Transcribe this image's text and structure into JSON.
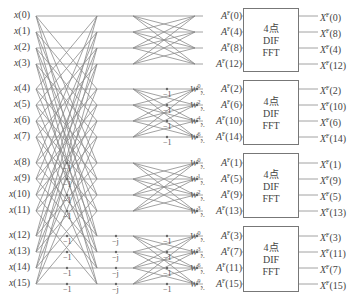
{
  "inputs": [
    "x(0)",
    "x(1)",
    "x(2)",
    "x(3)",
    "x(4)",
    "x(5)",
    "x(6)",
    "x(7)",
    "x(8)",
    "x(9)",
    "x(10)",
    "x(11)",
    "x(12)",
    "x(13)",
    "x(14)",
    "x(15)"
  ],
  "intermediate": [
    {
      "label": "A",
      "sup": "F",
      "idx": "(0)"
    },
    {
      "label": "A",
      "sup": "F",
      "idx": "(4)"
    },
    {
      "label": "A",
      "sup": "F",
      "idx": "(8)"
    },
    {
      "label": "A",
      "sup": "F",
      "idx": "(12)"
    },
    {
      "label": "A",
      "sup": "F",
      "idx": "(2)"
    },
    {
      "label": "A",
      "sup": "F",
      "idx": "(6)"
    },
    {
      "label": "A",
      "sup": "F",
      "idx": "(10)"
    },
    {
      "label": "A",
      "sup": "F",
      "idx": "(14)"
    },
    {
      "label": "A",
      "sup": "F",
      "idx": "(1)"
    },
    {
      "label": "A",
      "sup": "F",
      "idx": "(5)"
    },
    {
      "label": "A",
      "sup": "F",
      "idx": "(9)"
    },
    {
      "label": "A",
      "sup": "F",
      "idx": "(13)"
    },
    {
      "label": "A",
      "sup": "F",
      "idx": "(3)"
    },
    {
      "label": "A",
      "sup": "F",
      "idx": "(7)"
    },
    {
      "label": "A",
      "sup": "F",
      "idx": "(11)"
    },
    {
      "label": "A",
      "sup": "F",
      "idx": "(15)"
    }
  ],
  "twiddles": [
    {
      "row": 4,
      "exp": "0",
      "base": "W",
      "sub": "N"
    },
    {
      "row": 5,
      "exp": "2",
      "base": "W",
      "sub": "N"
    },
    {
      "row": 6,
      "exp": "4",
      "base": "W",
      "sub": "N"
    },
    {
      "row": 7,
      "exp": "6",
      "base": "W",
      "sub": "N"
    },
    {
      "row": 8,
      "exp": "0",
      "base": "W",
      "sub": "N"
    },
    {
      "row": 9,
      "exp": "1",
      "base": "W",
      "sub": "N"
    },
    {
      "row": 10,
      "exp": "2",
      "base": "W",
      "sub": "N"
    },
    {
      "row": 11,
      "exp": "3",
      "base": "W",
      "sub": "N"
    },
    {
      "row": 12,
      "exp": "0",
      "base": "W",
      "sub": "N"
    },
    {
      "row": 13,
      "exp": "3",
      "base": "W",
      "sub": "N"
    },
    {
      "row": 14,
      "exp": "6",
      "base": "W",
      "sub": "N"
    },
    {
      "row": 15,
      "exp": "9",
      "base": "W",
      "sub": "N"
    }
  ],
  "multipliers": {
    "stage1_minus_one": {
      "label": "−1",
      "rows": [
        8,
        9,
        10,
        11,
        12,
        13,
        14,
        15
      ]
    },
    "stage1_minus_j": {
      "label": "−j",
      "rows": [
        12,
        13,
        14,
        15
      ]
    },
    "stage2_minus_one": {
      "label": "−1",
      "rows": [
        4,
        5,
        6,
        7,
        12,
        13,
        14,
        15
      ]
    }
  },
  "blocks": [
    {
      "line1": "4点",
      "line2": "DIF",
      "line3": "FFT"
    },
    {
      "line1": "4点",
      "line2": "DIF",
      "line3": "FFT"
    },
    {
      "line1": "4点",
      "line2": "DIF",
      "line3": "FFT"
    },
    {
      "line1": "4点",
      "line2": "DIF",
      "line3": "FFT"
    }
  ],
  "outputs": [
    {
      "label": "X",
      "sup": "F",
      "idx": "(0)"
    },
    {
      "label": "X",
      "sup": "F",
      "idx": "(8)"
    },
    {
      "label": "X",
      "sup": "F",
      "idx": "(4)"
    },
    {
      "label": "X",
      "sup": "F",
      "idx": "(12)"
    },
    {
      "label": "X",
      "sup": "F",
      "idx": "(2)"
    },
    {
      "label": "X",
      "sup": "F",
      "idx": "(10)"
    },
    {
      "label": "X",
      "sup": "F",
      "idx": "(6)"
    },
    {
      "label": "X",
      "sup": "F",
      "idx": "(14)"
    },
    {
      "label": "X",
      "sup": "F",
      "idx": "(1)"
    },
    {
      "label": "X",
      "sup": "F",
      "idx": "(9)"
    },
    {
      "label": "X",
      "sup": "F",
      "idx": "(5)"
    },
    {
      "label": "X",
      "sup": "F",
      "idx": "(13)"
    },
    {
      "label": "X",
      "sup": "F",
      "idx": "(3)"
    },
    {
      "label": "X",
      "sup": "F",
      "idx": "(11)"
    },
    {
      "label": "X",
      "sup": "F",
      "idx": "(7)"
    },
    {
      "label": "X",
      "sup": "F",
      "idx": "(15)"
    }
  ],
  "colors": {
    "line": "#8a8a8a",
    "text": "#444444",
    "box_border": "#777777"
  }
}
